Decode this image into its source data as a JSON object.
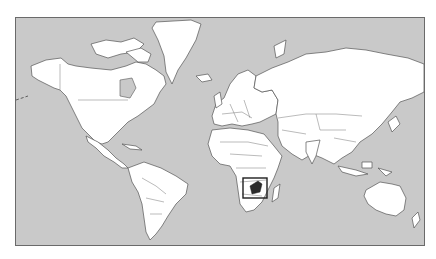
{
  "map": {
    "type": "world-locator-map",
    "projection": "mercator-like",
    "colors": {
      "ocean": "#c9c9c9",
      "land": "#ffffff",
      "coastline": "#555555",
      "highlight": "#2b2b2b",
      "locator_box": "#1e1e1e",
      "frame": "#6a6a6a"
    },
    "highlighted_region": {
      "name": "Zimbabwe",
      "continent": "Africa",
      "marked_with": "locator-box"
    },
    "visible_landmasses": [
      "North America",
      "Greenland",
      "South America",
      "Europe",
      "Africa",
      "Asia",
      "Australia",
      "Madagascar",
      "New Zealand",
      "Indonesia",
      "Japan"
    ],
    "labels": []
  }
}
